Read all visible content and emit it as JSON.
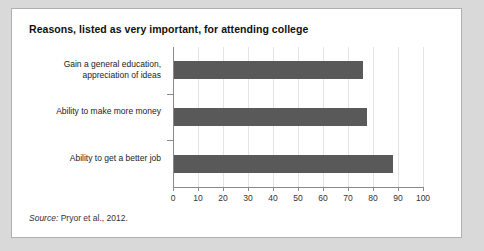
{
  "figure": {
    "title": "Reasons, listed as very important, for attending college",
    "source_label": "Source:",
    "source_text": "Pryor et al., 2012."
  },
  "chart_data": {
    "type": "bar",
    "orientation": "horizontal",
    "title": "Reasons, listed as very important, for attending college",
    "categories": [
      "Gain a general education,\nappreciation of ideas",
      "Ability to make more money",
      "Ability to get a better job"
    ],
    "values": [
      75.5,
      77,
      87.5
    ],
    "xlabel": "",
    "ylabel": "",
    "xlim": [
      0,
      100
    ],
    "xticks": [
      0,
      10,
      20,
      30,
      40,
      50,
      60,
      70,
      80,
      90,
      100
    ],
    "xtick_labels": [
      "0",
      "10",
      "20",
      "30",
      "40",
      "50",
      "60",
      "70",
      "80",
      "90",
      "100"
    ],
    "grid": true,
    "legend": false,
    "bar_color": "#595959",
    "gridline_color": "#e4e4e4",
    "axis_color": "#8a8a8a"
  }
}
